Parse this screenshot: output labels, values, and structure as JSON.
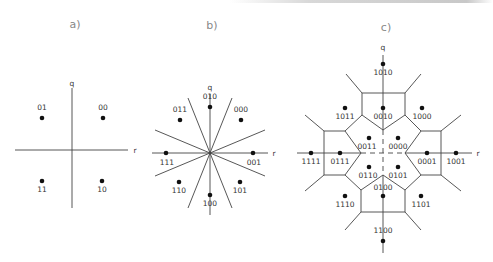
{
  "panels": {
    "a": {
      "title": "a)",
      "axis_q": "q",
      "axis_r": "r",
      "points": [
        {
          "label": "01",
          "x": 42,
          "y": 118,
          "lx": 42,
          "ly": 110
        },
        {
          "label": "00",
          "x": 103,
          "y": 118,
          "lx": 103,
          "ly": 110
        },
        {
          "label": "11",
          "x": 42,
          "y": 181,
          "lx": 42,
          "ly": 192
        },
        {
          "label": "10",
          "x": 102,
          "y": 181,
          "lx": 102,
          "ly": 192
        }
      ]
    },
    "b": {
      "title": "b)",
      "axis_q": "q",
      "axis_r": "r",
      "points": [
        {
          "label": "010",
          "x": 210,
          "y": 107,
          "lx": 210,
          "ly": 99
        },
        {
          "label": "011",
          "x": 180,
          "y": 120,
          "lx": 180,
          "ly": 112
        },
        {
          "label": "000",
          "x": 241,
          "y": 120,
          "lx": 241,
          "ly": 112
        },
        {
          "label": "111",
          "x": 166,
          "y": 153,
          "lx": 167,
          "ly": 165
        },
        {
          "label": "001",
          "x": 253,
          "y": 153,
          "lx": 254,
          "ly": 165
        },
        {
          "label": "110",
          "x": 179,
          "y": 182,
          "lx": 179,
          "ly": 193
        },
        {
          "label": "101",
          "x": 240,
          "y": 182,
          "lx": 240,
          "ly": 193
        },
        {
          "label": "100",
          "x": 210,
          "y": 195,
          "lx": 210,
          "ly": 206
        }
      ]
    },
    "c": {
      "title": "c)",
      "axis_q": "q",
      "axis_r": "r",
      "points": [
        {
          "label": "1010",
          "x": 383,
          "y": 64,
          "lx": 383,
          "ly": 75
        },
        {
          "label": "0010",
          "x": 383,
          "y": 108,
          "lx": 383,
          "ly": 119
        },
        {
          "label": "1011",
          "x": 345,
          "y": 108,
          "lx": 345,
          "ly": 119
        },
        {
          "label": "1000",
          "x": 422,
          "y": 108,
          "lx": 422,
          "ly": 119
        },
        {
          "label": "0011",
          "x": 369,
          "y": 138,
          "lx": 367,
          "ly": 149
        },
        {
          "label": "0000",
          "x": 398,
          "y": 138,
          "lx": 398,
          "ly": 149
        },
        {
          "label": "1111",
          "x": 311,
          "y": 153,
          "lx": 311,
          "ly": 164
        },
        {
          "label": "0111",
          "x": 340,
          "y": 153,
          "lx": 340,
          "ly": 164
        },
        {
          "label": "0001",
          "x": 427,
          "y": 153,
          "lx": 427,
          "ly": 164
        },
        {
          "label": "1001",
          "x": 456,
          "y": 153,
          "lx": 456,
          "ly": 164
        },
        {
          "label": "0110",
          "x": 369,
          "y": 167,
          "lx": 368,
          "ly": 178
        },
        {
          "label": "0101",
          "x": 398,
          "y": 167,
          "lx": 398,
          "ly": 178
        },
        {
          "label": "0100",
          "x": 383,
          "y": 196,
          "lx": 383,
          "ly": 190
        },
        {
          "label": "1110",
          "x": 345,
          "y": 196,
          "lx": 345,
          "ly": 207
        },
        {
          "label": "1101",
          "x": 421,
          "y": 196,
          "lx": 421,
          "ly": 207
        },
        {
          "label": "1100",
          "x": 383,
          "y": 241,
          "lx": 383,
          "ly": 233
        }
      ]
    }
  }
}
